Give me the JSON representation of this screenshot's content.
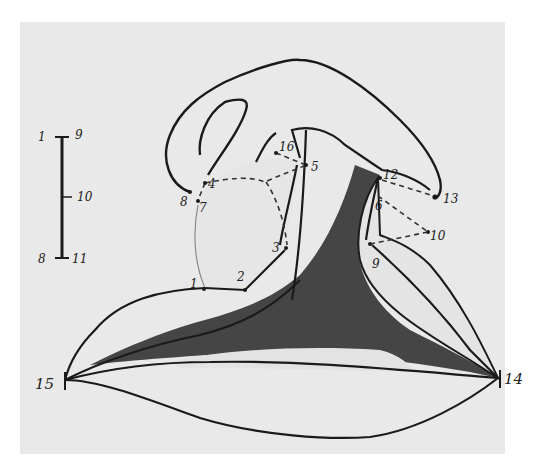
{
  "figure": {
    "type": "hand-drawn anatomical sketch with numbered landmarks",
    "colors": {
      "paper": "#e9e9e9",
      "ink": "#1a1a1a",
      "shade_dark": "#2a2a2a",
      "shade_light": "#dcdcdc"
    }
  },
  "scale_bar": {
    "top_left_label": "1",
    "top_right_label": "9",
    "middle_label": "10",
    "bottom_left_label": "8",
    "bottom_right_label": "11"
  },
  "landmarks": {
    "p1": "1",
    "p2": "2",
    "p3": "3",
    "p4": "4",
    "p5": "5",
    "p6": "6",
    "p7": "7",
    "p8": "8",
    "p9": "9",
    "p10": "10",
    "p12": "12",
    "p13": "13",
    "p14": "14",
    "p15": "15",
    "p16": "16"
  }
}
